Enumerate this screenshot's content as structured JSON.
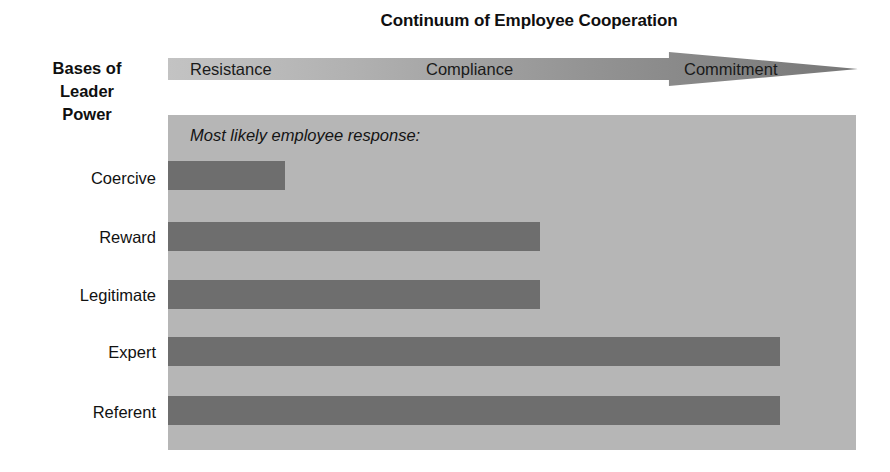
{
  "chart_data": {
    "type": "bar",
    "orientation": "horizontal",
    "title": "Continuum of Employee Cooperation",
    "axis_heading_lines": [
      "Bases of",
      "Leader",
      "Power"
    ],
    "panel_note": "Most likely employee response:",
    "xlabel": "",
    "ylabel": "Bases of Leader Power",
    "continuum_labels": [
      "Resistance",
      "Compliance",
      "Commitment"
    ],
    "continuum_scale": [
      0,
      100
    ],
    "categories": [
      "Coercive",
      "Reward",
      "Legitimate",
      "Expert",
      "Referent"
    ],
    "values": [
      17,
      54,
      54,
      89,
      89
    ],
    "value_meanings": [
      "Resistance",
      "Compliance",
      "Compliance",
      "Commitment",
      "Commitment"
    ],
    "grid": false,
    "legend": false,
    "colors": {
      "bar": "#6e6e6e",
      "panel": "#b6b6b6",
      "arrow_start": "#c3c3c3",
      "arrow_end": "#787878",
      "text": "#111111",
      "background": "#ffffff"
    }
  }
}
